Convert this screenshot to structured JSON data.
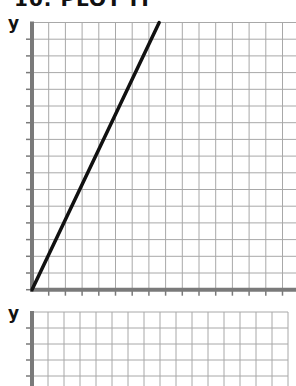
{
  "title": "10. PLOT IT",
  "chart_data": [
    {
      "type": "line",
      "title": "",
      "xlabel": "",
      "ylabel": "y",
      "grid": true,
      "grid_columns": 16,
      "grid_rows": 16,
      "xlim": [
        0,
        16
      ],
      "ylim": [
        0,
        16
      ],
      "series": [
        {
          "name": "line",
          "x": [
            0,
            8
          ],
          "y": [
            0,
            16
          ]
        }
      ]
    },
    {
      "type": "line",
      "title": "",
      "xlabel": "",
      "ylabel": "y",
      "grid": true,
      "grid_columns": 16,
      "grid_rows": 5,
      "series": []
    }
  ],
  "colors": {
    "axis": "#7a7a7a",
    "grid": "#a8a8a8",
    "line": "#111111"
  }
}
